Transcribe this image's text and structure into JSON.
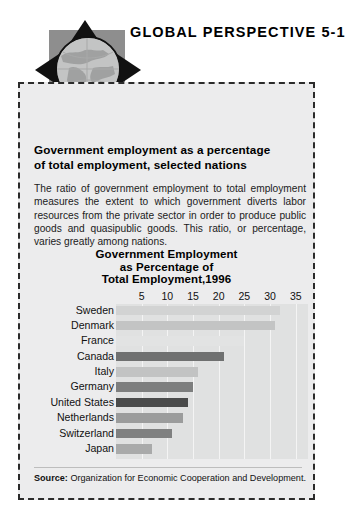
{
  "header": {
    "title": "GLOBAL PERSPECTIVE 5-1",
    "logo_icon": "globe-arrows-icon"
  },
  "panel": {
    "headline_line1": "Government employment as a percentage",
    "headline_line2": "of total employment, selected nations",
    "body": "The ratio of government employment to total employment measures the extent to which government diverts labor resources from the private sector in order to produce public goods and quasipublic goods. This ratio, or percentage, varies greatly among nations.",
    "source_label": "Source:",
    "source_text": " Organization for Economic Cooperation and Development."
  },
  "chart_data": {
    "type": "bar",
    "orientation": "horizontal",
    "title_line1": "Government Employment",
    "title_line2": "as Percentage of",
    "title_line3": "Total Employment,1996",
    "title": "Government Employment as Percentage of Total Employment,1996",
    "xlabel": "",
    "ylabel": "",
    "xlim": [
      0,
      37
    ],
    "ticks": [
      5,
      10,
      15,
      20,
      25,
      30,
      35
    ],
    "grid": true,
    "legend": "none",
    "categories": [
      "Sweden",
      "Denmark",
      "France",
      "Canada",
      "Italy",
      "Germany",
      "United States",
      "Netherlands",
      "Switzerland",
      "Japan"
    ],
    "values": [
      32,
      31,
      25,
      21,
      16,
      15,
      14,
      13,
      11,
      7
    ],
    "bar_colors": [
      "#d2d3d3",
      "#c3c4c4",
      "#e2e3e3",
      "#6f7070",
      "#c2c3c3",
      "#7d7e7e",
      "#4a4b4b",
      "#9b9c9c",
      "#7f8080",
      "#a9aaaa"
    ]
  },
  "colors": {
    "panel_background": "#ececed",
    "panel_border": "#2b2b2b",
    "plot_background": "#e0e1e1",
    "gridline": "#f4f4f4",
    "text": "#111111",
    "logo_square": "#8e8e8e",
    "globe_fill": "#b9b9b9"
  }
}
